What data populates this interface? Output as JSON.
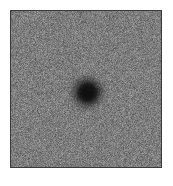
{
  "figure": {
    "kind": "grayscale-noise-image",
    "canvas": {
      "width": 173,
      "height": 186,
      "background_color": "#ffffff"
    },
    "panel": {
      "left": 10,
      "top": 10,
      "width": 150,
      "height": 156,
      "border_color": "#3a3a3a",
      "border_width": 1
    }
  },
  "chart_data": {
    "type": "heatmap",
    "title": "",
    "subtitle": "",
    "xlabel": "",
    "ylabel": "",
    "legend": [],
    "annotations": [],
    "grid": false,
    "axis_ticks_visible": false,
    "colormap": "grayscale",
    "colormap_low_color": "#000000",
    "colormap_high_color": "#ffffff",
    "pixel_grid": {
      "cols": 150,
      "rows": 156
    },
    "background_level": 125,
    "noise_amplitude": 62,
    "value_min": 8,
    "value_max": 205,
    "features": [
      {
        "name": "central-dark-blob",
        "shape": "circular",
        "center_x": 76,
        "center_y": 81,
        "core_radius": 9,
        "halo_radius": 23,
        "core_level": 16,
        "contrast": "negative"
      }
    ],
    "random_seed": 20240517
  }
}
